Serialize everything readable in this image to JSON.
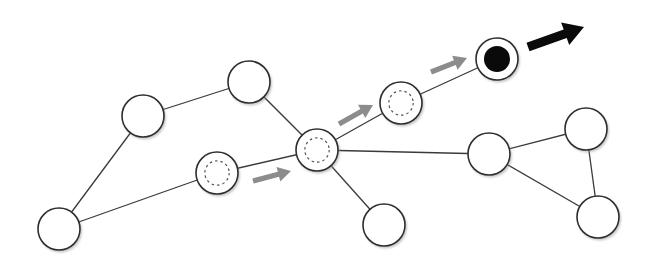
{
  "diagram": {
    "type": "graph-walk",
    "colors": {
      "edge": "#3a3a3a",
      "node_fill": "#ffffff",
      "node_stroke": "#2e2e2e",
      "visited_ring": "#555555",
      "current_core": "#0a0a0a",
      "past_arrow": "#8c8c8c",
      "next_arrow": "#0a0a0a"
    },
    "nodes": [
      {
        "id": "A",
        "x": 59,
        "y": 229,
        "r": 21,
        "state": "unvisited"
      },
      {
        "id": "B",
        "x": 143,
        "y": 116,
        "r": 21,
        "state": "unvisited"
      },
      {
        "id": "C",
        "x": 249,
        "y": 82,
        "r": 21,
        "state": "unvisited"
      },
      {
        "id": "D",
        "x": 217,
        "y": 173,
        "r": 21,
        "state": "visited"
      },
      {
        "id": "E",
        "x": 317,
        "y": 150,
        "r": 21,
        "state": "visited"
      },
      {
        "id": "F",
        "x": 401,
        "y": 103,
        "r": 21,
        "state": "visited"
      },
      {
        "id": "G",
        "x": 497,
        "y": 59,
        "r": 21,
        "state": "current"
      },
      {
        "id": "H",
        "x": 384,
        "y": 225,
        "r": 21,
        "state": "unvisited"
      },
      {
        "id": "I",
        "x": 489,
        "y": 154,
        "r": 21,
        "state": "unvisited"
      },
      {
        "id": "J",
        "x": 586,
        "y": 129,
        "r": 21,
        "state": "unvisited"
      },
      {
        "id": "K",
        "x": 598,
        "y": 217,
        "r": 21,
        "state": "unvisited"
      }
    ],
    "edges": [
      [
        "A",
        "B"
      ],
      [
        "B",
        "C"
      ],
      [
        "C",
        "E"
      ],
      [
        "A",
        "D"
      ],
      [
        "D",
        "E"
      ],
      [
        "E",
        "F"
      ],
      [
        "F",
        "G"
      ],
      [
        "E",
        "H"
      ],
      [
        "E",
        "I"
      ],
      [
        "I",
        "J"
      ],
      [
        "I",
        "K"
      ],
      [
        "J",
        "K"
      ]
    ],
    "arrows": [
      {
        "id": "step-1",
        "from": [
          253,
          181
        ],
        "to": [
          291,
          171
        ],
        "kind": "past"
      },
      {
        "id": "step-2",
        "from": [
          339,
          124
        ],
        "to": [
          373,
          105
        ],
        "kind": "past"
      },
      {
        "id": "step-3",
        "from": [
          431,
          72
        ],
        "to": [
          467,
          58
        ],
        "kind": "past"
      },
      {
        "id": "next",
        "from": [
          528,
          47
        ],
        "to": [
          584,
          27
        ],
        "kind": "next"
      }
    ]
  }
}
